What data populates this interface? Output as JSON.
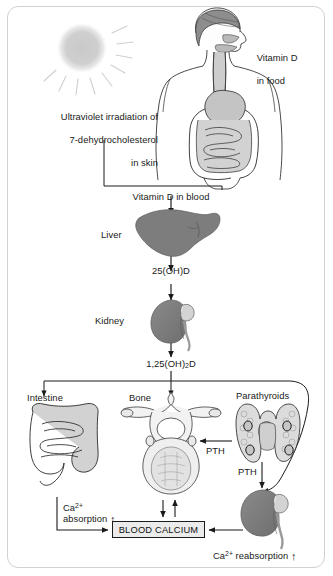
{
  "figure": {
    "frame_color": "#d2d2d2",
    "ink_color": "#1a1a1a",
    "organ_fill_dark": "#7d7d7d",
    "organ_fill_light": "#d8d8d8",
    "box_fill": "#ebebeb"
  },
  "labels": {
    "uv_line1": "Ultraviolet irradiation of",
    "uv_line2": "7-dehydrocholesterol",
    "uv_line3": "in skin",
    "vitamin_d_food_line1": "Vitamin D",
    "vitamin_d_food_line2": "in food",
    "vitamin_d_blood": "Vitamin D in blood",
    "liver": "Liver",
    "calcidiol": "25(OH)D",
    "kidney": "Kidney",
    "calcitriol_pre": "1,25(OH)",
    "calcitriol_sub": "2",
    "calcitriol_post": "D",
    "intestine": "Intestine",
    "bone": "Bone",
    "parathyroids": "Parathyroids",
    "pth_bone": "PTH",
    "pth_kidney": "PTH",
    "ca_absorption_ion": "Ca",
    "ca_absorption_charge": "2+",
    "ca_absorption_text": "absorption",
    "ca_reabsorption_ion": "Ca",
    "ca_reabsorption_charge": "2+",
    "ca_reabsorption_text": "reabsorption",
    "blood_calcium": "BLOOD CALCIUM",
    "increase_arrow": "↑"
  },
  "icons": {
    "sun": "sun-icon",
    "body": "human-torso-icon",
    "liver": "liver-icon",
    "kidney": "kidney-icon",
    "intestine": "intestine-icon",
    "bone": "vertebra-icon",
    "parathyroid": "parathyroid-gland-icon"
  }
}
